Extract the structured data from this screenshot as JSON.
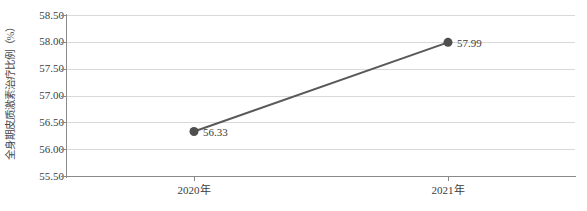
{
  "chart_data": {
    "type": "line",
    "title": "",
    "xlabel": "",
    "ylabel": "全身期皮质激素治疗比例（%）",
    "categories": [
      "2020年",
      "2021年"
    ],
    "values": [
      56.33,
      57.99
    ],
    "series": [
      {
        "name": "全身期皮质激素治疗比例",
        "values": [
          56.33,
          57.99
        ],
        "point_labels": [
          "56.33",
          "57.99"
        ]
      }
    ],
    "ylim": [
      55.5,
      58.5
    ],
    "ytick_labels": [
      "58.50",
      "58.00",
      "57.50",
      "57.00",
      "56.50",
      "56.00",
      "55.50"
    ],
    "ytick_values": [
      58.5,
      58.0,
      57.5,
      57.0,
      56.5,
      56.0,
      55.5
    ],
    "grid": true,
    "legend": false,
    "legend_position": "none",
    "colors": {
      "line": "#595959",
      "marker": "#4f4f4f",
      "gridline": "#d9d9d9",
      "axis": "#8a8a8a",
      "text": "#3d3d3d",
      "background": "#ffffff"
    }
  }
}
